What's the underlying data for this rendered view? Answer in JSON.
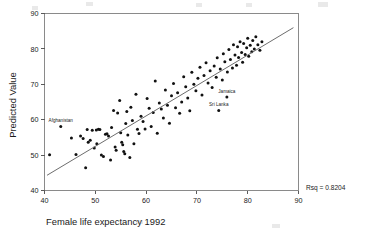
{
  "chart_data": {
    "type": "scatter",
    "title": "",
    "xlabel": "Female life expectancy 1992",
    "ylabel": "Predicted Value",
    "xlim": [
      40,
      90
    ],
    "ylim": [
      40,
      90
    ],
    "xticks": [
      40,
      50,
      60,
      70,
      80,
      90
    ],
    "yticks": [
      40,
      50,
      60,
      70,
      80,
      90
    ],
    "grid": false,
    "legend": null,
    "annotations": [
      {
        "text": "Rsq = 0.8204",
        "position": "outside-bottom-right"
      }
    ],
    "statistic": {
      "name": "Rsq",
      "value": 0.8204,
      "display": "Rsq = 0.8204"
    },
    "fit_line": {
      "type": "linear-regression",
      "x_start": 40.5,
      "y_start": 44.3,
      "x_end": 89.0,
      "y_end": 86.0
    },
    "point_labels": [
      {
        "label": "Afghanistan",
        "x": 43.2,
        "y": 58.1
      },
      {
        "label": "Jamaica",
        "x": 75.9,
        "y": 66.4
      },
      {
        "label": "Sri Lanka",
        "x": 74.3,
        "y": 62.6
      }
    ],
    "points": [
      {
        "x": 41.0,
        "y": 50.1
      },
      {
        "x": 43.2,
        "y": 58.1
      },
      {
        "x": 45.3,
        "y": 54.8
      },
      {
        "x": 46.2,
        "y": 50.2
      },
      {
        "x": 47.1,
        "y": 55.4
      },
      {
        "x": 47.6,
        "y": 54.7
      },
      {
        "x": 48.1,
        "y": 46.4
      },
      {
        "x": 48.4,
        "y": 57.2
      },
      {
        "x": 48.6,
        "y": 53.6
      },
      {
        "x": 49.0,
        "y": 54.2
      },
      {
        "x": 49.4,
        "y": 57.0
      },
      {
        "x": 49.8,
        "y": 52.0
      },
      {
        "x": 50.2,
        "y": 57.1
      },
      {
        "x": 50.3,
        "y": 53.2
      },
      {
        "x": 50.6,
        "y": 57.3
      },
      {
        "x": 50.9,
        "y": 57.2
      },
      {
        "x": 51.2,
        "y": 50.0
      },
      {
        "x": 51.6,
        "y": 49.6
      },
      {
        "x": 52.0,
        "y": 55.9
      },
      {
        "x": 52.3,
        "y": 56.0
      },
      {
        "x": 52.6,
        "y": 55.4
      },
      {
        "x": 53.0,
        "y": 48.6
      },
      {
        "x": 53.2,
        "y": 57.8
      },
      {
        "x": 53.6,
        "y": 62.6
      },
      {
        "x": 53.9,
        "y": 52.3
      },
      {
        "x": 54.1,
        "y": 51.4
      },
      {
        "x": 54.4,
        "y": 61.9
      },
      {
        "x": 54.8,
        "y": 65.4
      },
      {
        "x": 55.0,
        "y": 56.3
      },
      {
        "x": 55.2,
        "y": 53.6
      },
      {
        "x": 55.4,
        "y": 52.9
      },
      {
        "x": 55.6,
        "y": 51.0
      },
      {
        "x": 55.8,
        "y": 50.4
      },
      {
        "x": 56.0,
        "y": 58.9
      },
      {
        "x": 56.2,
        "y": 62.3
      },
      {
        "x": 56.4,
        "y": 55.7
      },
      {
        "x": 56.8,
        "y": 49.3
      },
      {
        "x": 57.0,
        "y": 63.5
      },
      {
        "x": 57.3,
        "y": 59.8
      },
      {
        "x": 57.6,
        "y": 53.2
      },
      {
        "x": 58.0,
        "y": 67.2
      },
      {
        "x": 58.3,
        "y": 57.3
      },
      {
        "x": 58.6,
        "y": 56.1
      },
      {
        "x": 59.0,
        "y": 61.0
      },
      {
        "x": 59.4,
        "y": 59.5
      },
      {
        "x": 59.8,
        "y": 57.4
      },
      {
        "x": 60.2,
        "y": 66.0
      },
      {
        "x": 60.6,
        "y": 63.2
      },
      {
        "x": 61.0,
        "y": 58.1
      },
      {
        "x": 61.4,
        "y": 62.0
      },
      {
        "x": 61.8,
        "y": 70.9
      },
      {
        "x": 62.2,
        "y": 56.2
      },
      {
        "x": 62.6,
        "y": 64.7
      },
      {
        "x": 63.0,
        "y": 63.0
      },
      {
        "x": 63.4,
        "y": 60.5
      },
      {
        "x": 63.8,
        "y": 68.4
      },
      {
        "x": 64.2,
        "y": 64.1
      },
      {
        "x": 64.6,
        "y": 59.0
      },
      {
        "x": 65.0,
        "y": 66.8
      },
      {
        "x": 65.4,
        "y": 70.2
      },
      {
        "x": 65.8,
        "y": 63.4
      },
      {
        "x": 66.2,
        "y": 67.6
      },
      {
        "x": 66.6,
        "y": 61.8
      },
      {
        "x": 67.0,
        "y": 65.0
      },
      {
        "x": 67.4,
        "y": 72.1
      },
      {
        "x": 67.8,
        "y": 69.3
      },
      {
        "x": 68.2,
        "y": 66.1
      },
      {
        "x": 68.6,
        "y": 62.5
      },
      {
        "x": 69.0,
        "y": 73.4
      },
      {
        "x": 69.4,
        "y": 70.0
      },
      {
        "x": 69.8,
        "y": 68.2
      },
      {
        "x": 70.2,
        "y": 71.7
      },
      {
        "x": 70.6,
        "y": 74.8
      },
      {
        "x": 71.0,
        "y": 67.0
      },
      {
        "x": 71.4,
        "y": 72.5
      },
      {
        "x": 71.8,
        "y": 76.1
      },
      {
        "x": 72.2,
        "y": 70.4
      },
      {
        "x": 72.6,
        "y": 73.8
      },
      {
        "x": 73.0,
        "y": 69.1
      },
      {
        "x": 73.4,
        "y": 75.2
      },
      {
        "x": 73.8,
        "y": 72.0
      },
      {
        "x": 74.0,
        "y": 77.5
      },
      {
        "x": 74.3,
        "y": 62.6
      },
      {
        "x": 74.6,
        "y": 74.3
      },
      {
        "x": 75.0,
        "y": 71.2
      },
      {
        "x": 75.2,
        "y": 78.6
      },
      {
        "x": 75.5,
        "y": 76.4
      },
      {
        "x": 75.9,
        "y": 66.4
      },
      {
        "x": 76.0,
        "y": 73.5
      },
      {
        "x": 76.3,
        "y": 79.8
      },
      {
        "x": 76.6,
        "y": 77.0
      },
      {
        "x": 77.0,
        "y": 74.6
      },
      {
        "x": 77.2,
        "y": 81.2
      },
      {
        "x": 77.5,
        "y": 78.3
      },
      {
        "x": 77.8,
        "y": 75.4
      },
      {
        "x": 78.0,
        "y": 80.6
      },
      {
        "x": 78.2,
        "y": 77.6
      },
      {
        "x": 78.5,
        "y": 82.0
      },
      {
        "x": 78.8,
        "y": 79.0
      },
      {
        "x": 79.0,
        "y": 76.2
      },
      {
        "x": 79.2,
        "y": 81.5
      },
      {
        "x": 79.5,
        "y": 78.4
      },
      {
        "x": 79.8,
        "y": 80.3
      },
      {
        "x": 80.0,
        "y": 83.0
      },
      {
        "x": 80.2,
        "y": 77.9
      },
      {
        "x": 80.5,
        "y": 81.0
      },
      {
        "x": 80.8,
        "y": 79.2
      },
      {
        "x": 81.0,
        "y": 82.4
      },
      {
        "x": 81.3,
        "y": 80.0
      },
      {
        "x": 81.6,
        "y": 83.4
      },
      {
        "x": 82.0,
        "y": 81.2
      },
      {
        "x": 82.4,
        "y": 79.6
      },
      {
        "x": 82.8,
        "y": 82.0
      }
    ]
  }
}
